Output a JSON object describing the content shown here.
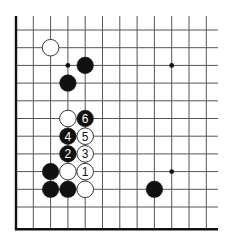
{
  "diagram": {
    "type": "go-board-fragment",
    "grid": {
      "columns": 12,
      "rows": 12,
      "origin_x": 16,
      "origin_y": 30,
      "spacing_x": 17.3,
      "spacing_y": 17.7,
      "right_extent": 218,
      "top_extent": 16,
      "edges": [
        "left",
        "bottom"
      ]
    },
    "colors": {
      "line": "#555555",
      "edge": "#111111",
      "black_stone": "#111111",
      "white_stone": "#ffffff",
      "white_outline": "#222222"
    },
    "star_points": [
      {
        "col": 3,
        "row": 2
      },
      {
        "col": 9,
        "row": 2
      },
      {
        "col": 9,
        "row": 8
      }
    ],
    "stones": [
      {
        "color": "white",
        "col": 2,
        "row": 1,
        "label": ""
      },
      {
        "color": "black",
        "col": 4,
        "row": 2,
        "label": ""
      },
      {
        "color": "black",
        "col": 3,
        "row": 3,
        "label": ""
      },
      {
        "color": "white",
        "col": 3,
        "row": 5,
        "label": ""
      },
      {
        "color": "black",
        "col": 4,
        "row": 5,
        "label": "6"
      },
      {
        "color": "black",
        "col": 3,
        "row": 6,
        "label": "4"
      },
      {
        "color": "white",
        "col": 4,
        "row": 6,
        "label": "5"
      },
      {
        "color": "black",
        "col": 3,
        "row": 7,
        "label": "2"
      },
      {
        "color": "white",
        "col": 4,
        "row": 7,
        "label": "3"
      },
      {
        "color": "black",
        "col": 2,
        "row": 8,
        "label": ""
      },
      {
        "color": "white",
        "col": 3,
        "row": 8,
        "label": ""
      },
      {
        "color": "white",
        "col": 4,
        "row": 8,
        "label": "1"
      },
      {
        "color": "black",
        "col": 2,
        "row": 9,
        "label": ""
      },
      {
        "color": "black",
        "col": 3,
        "row": 9,
        "label": ""
      },
      {
        "color": "white",
        "col": 4,
        "row": 9,
        "label": ""
      },
      {
        "color": "black",
        "col": 8,
        "row": 9,
        "label": ""
      }
    ]
  }
}
